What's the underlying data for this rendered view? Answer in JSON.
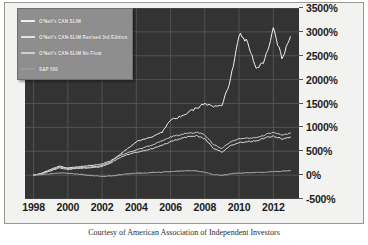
{
  "chart_data": {
    "type": "line",
    "title": "",
    "xlabel": "",
    "ylabel": "",
    "grid": true,
    "legend_position": "top-left",
    "xlim": [
      1997.5,
      2013.5
    ],
    "ylim": [
      -500,
      3500
    ],
    "x_ticks": [
      "1998",
      "2000",
      "2002",
      "2004",
      "2006",
      "2008",
      "2010",
      "2012"
    ],
    "x_tick_values": [
      1998,
      2000,
      2002,
      2004,
      2006,
      2008,
      2010,
      2012
    ],
    "y_ticks": [
      "3500%",
      "3000%",
      "2500%",
      "2000%",
      "1500%",
      "1000%",
      "500%",
      "0%",
      "-500%"
    ],
    "y_tick_values": [
      3500,
      3000,
      2500,
      2000,
      1500,
      1000,
      500,
      0,
      -500
    ],
    "x": [
      1998.0,
      1998.5,
      1999.0,
      1999.5,
      2000.0,
      2000.5,
      2001.0,
      2001.5,
      2002.0,
      2002.5,
      2003.0,
      2003.5,
      2004.0,
      2004.5,
      2005.0,
      2005.5,
      2006.0,
      2006.5,
      2007.0,
      2007.5,
      2008.0,
      2008.5,
      2009.0,
      2009.5,
      2010.0,
      2010.5,
      2011.0,
      2011.5,
      2012.0,
      2012.5,
      2013.0
    ],
    "series": [
      {
        "name": "O'Neil's CAN SLIM",
        "color": "#f0f0f0",
        "values": [
          0,
          40,
          120,
          190,
          150,
          170,
          190,
          210,
          230,
          300,
          420,
          560,
          700,
          760,
          820,
          900,
          1150,
          1220,
          1300,
          1400,
          1500,
          1430,
          1450,
          2000,
          2950,
          2800,
          2200,
          2400,
          3050,
          2450,
          2900
        ]
      },
      {
        "name": "O'Neil's CAN-SLIM Revised 3rd Edition",
        "color": "#e2e2e2",
        "values": [
          0,
          30,
          90,
          150,
          120,
          140,
          150,
          160,
          180,
          250,
          360,
          430,
          480,
          520,
          560,
          620,
          700,
          760,
          800,
          820,
          760,
          560,
          480,
          620,
          680,
          700,
          720,
          780,
          820,
          760,
          800
        ]
      },
      {
        "name": "O'Neil's CAN-SLIM No Float",
        "color": "#cfcfcf",
        "values": [
          0,
          35,
          100,
          170,
          140,
          150,
          165,
          175,
          200,
          280,
          400,
          470,
          530,
          580,
          640,
          720,
          800,
          840,
          880,
          900,
          840,
          640,
          560,
          700,
          760,
          770,
          790,
          840,
          900,
          840,
          880
        ]
      },
      {
        "name": "S&P 500",
        "color": "#9a9a9a",
        "values": [
          0,
          15,
          30,
          45,
          40,
          20,
          5,
          -10,
          -25,
          -15,
          5,
          25,
          40,
          45,
          55,
          60,
          75,
          85,
          95,
          90,
          60,
          10,
          -5,
          25,
          45,
          50,
          55,
          60,
          75,
          80,
          95
        ]
      }
    ]
  },
  "legend": {
    "items": [
      {
        "label": "O'Neil's CAN SLIM"
      },
      {
        "label": "O'Neil's CAN-SLIM Revised 3rd Edition"
      },
      {
        "label": "O'Neil's CAN-SLIM No Float"
      },
      {
        "label": "S&P 500"
      }
    ]
  },
  "caption": "Courtesy of American Association of Independent Investors",
  "colors": {
    "plot_background": "#333333",
    "frame_background": "#f2f2f0",
    "gridline": "#5a5a5a",
    "legend_background": "#8e8e8e",
    "axis_text": "#1b1b1b"
  }
}
